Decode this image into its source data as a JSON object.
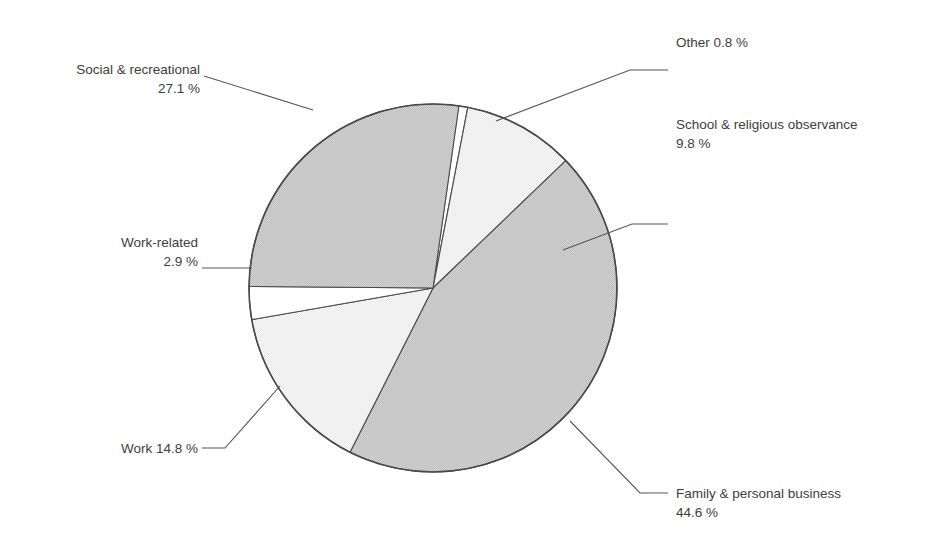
{
  "figure": {
    "type": "pie-chart",
    "background_color": "#ffffff",
    "text_color": "#3d3d3d",
    "outline_color": "#4a4a4a",
    "leader_color": "#555555"
  },
  "chart_data": {
    "type": "pie",
    "title": "",
    "subtitle": "",
    "xlabel": "",
    "ylabel": "",
    "grid": false,
    "legend_position": "callout-labels",
    "units": "%",
    "total": 100.0,
    "categories": [
      "Other",
      "School & religious observance",
      "Family & personal business",
      "Work",
      "Work-related",
      "Social & recreational"
    ],
    "values": [
      0.8,
      9.8,
      44.6,
      14.8,
      2.9,
      27.1
    ],
    "slices": [
      {
        "id": "other",
        "label": "Other",
        "value": 0.8,
        "value_text": "0.8 %",
        "label_line1": "Other  0.8 %",
        "label_line2": "",
        "fill": "#ffffff",
        "start_angle": -82.0,
        "sweep": 2.9
      },
      {
        "id": "school-religious",
        "label": "School & religious observance",
        "value": 9.8,
        "value_text": "9.8 %",
        "label_line1": "School & religious observance",
        "label_line2": "9.8 %",
        "fill": "#f1f1f1",
        "start_angle": -79.1,
        "sweep": 35.3
      },
      {
        "id": "family-personal-business",
        "label": "Family & personal business",
        "value": 44.6,
        "value_text": "44.6 %",
        "label_line1": "Family & personal business",
        "label_line2": "44.6 %",
        "fill": "#c9c9c9",
        "start_angle": -43.8,
        "sweep": 160.6
      },
      {
        "id": "work",
        "label": "Work",
        "value": 14.8,
        "value_text": "14.8 %",
        "label_line1": "Work  14.8 %",
        "label_line2": "",
        "fill": "#f1f1f1",
        "start_angle": 116.8,
        "sweep": 53.3
      },
      {
        "id": "work-related",
        "label": "Work-related",
        "value": 2.9,
        "value_text": "2.9 %",
        "label_line1": "Work-related",
        "label_line2": "2.9 %",
        "fill": "#ffffff",
        "start_angle": 170.1,
        "sweep": 10.4
      },
      {
        "id": "social-recreational",
        "label": "Social & recreational",
        "value": 27.1,
        "value_text": "27.1 %",
        "label_line1": "Social & recreational",
        "label_line2": "27.1 %",
        "fill": "#c9c9c9",
        "start_angle": 180.5,
        "sweep": 97.6
      }
    ]
  },
  "labels": {
    "social_recreational": {
      "line1": "Social & recreational",
      "line2": "27.1 %"
    },
    "work_related": {
      "line1": "Work-related",
      "line2": "2.9 %"
    },
    "work": {
      "line1": "Work  14.8 %",
      "line2": ""
    },
    "other": {
      "line1": "Other  0.8 %",
      "line2": ""
    },
    "school_religious": {
      "line1": "School & religious observance",
      "line2": "9.8 %"
    },
    "family_personal_business": {
      "line1": "Family & personal business",
      "line2": "44.6 %"
    }
  }
}
